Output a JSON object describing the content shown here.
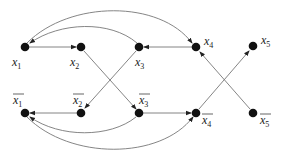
{
  "diagram": {
    "type": "directed-graph",
    "colors": {
      "node": "#111111",
      "edge": "#777777",
      "label": "#222222"
    },
    "nodes": [
      {
        "id": "x1",
        "label": "x",
        "sub": "1",
        "bar": false,
        "x": 25,
        "y": 47,
        "lx": 12,
        "ly": 66
      },
      {
        "id": "x2",
        "label": "x",
        "sub": "2",
        "bar": false,
        "x": 81,
        "y": 47,
        "lx": 70,
        "ly": 66
      },
      {
        "id": "x3",
        "label": "x",
        "sub": "3",
        "bar": false,
        "x": 139,
        "y": 47,
        "lx": 135,
        "ly": 66
      },
      {
        "id": "x4",
        "label": "x",
        "sub": "4",
        "bar": false,
        "x": 196,
        "y": 47,
        "lx": 204,
        "ly": 45
      },
      {
        "id": "x5",
        "label": "x",
        "sub": "5",
        "bar": false,
        "x": 253,
        "y": 46,
        "lx": 261,
        "ly": 44
      },
      {
        "id": "x1bar",
        "label": "x",
        "sub": "1",
        "bar": true,
        "x": 25,
        "y": 113,
        "lx": 13,
        "ly": 104
      },
      {
        "id": "x2bar",
        "label": "x",
        "sub": "2",
        "bar": true,
        "x": 81,
        "y": 113,
        "lx": 73,
        "ly": 104
      },
      {
        "id": "x3bar",
        "label": "x",
        "sub": "3",
        "bar": true,
        "x": 139,
        "y": 113,
        "lx": 139,
        "ly": 104
      },
      {
        "id": "x4bar",
        "label": "x",
        "sub": "4",
        "bar": true,
        "x": 196,
        "y": 113,
        "lx": 202,
        "ly": 124
      },
      {
        "id": "x5bar",
        "label": "x",
        "sub": "5",
        "bar": true,
        "x": 253,
        "y": 113,
        "lx": 260,
        "ly": 124
      }
    ],
    "edges": [
      {
        "from": "x1",
        "to": "x2",
        "d": "M29,47 L76,47"
      },
      {
        "from": "x4",
        "to": "x3",
        "d": "M192,47 L144,47"
      },
      {
        "from": "x3",
        "to": "x1",
        "d": "M137,43 C110,20 60,22 30,43"
      },
      {
        "from": "x1",
        "to": "x4",
        "d": "M27,43 C70,0 160,0 192,43"
      },
      {
        "from": "x2",
        "to": "x3bar",
        "d": "M84,51 L136,109"
      },
      {
        "from": "x3",
        "to": "x2bar",
        "d": "M136,51 L85,108"
      },
      {
        "from": "x4bar",
        "to": "x5",
        "d": "M199,109 L249,51"
      },
      {
        "from": "x5bar",
        "to": "x4",
        "d": "M250,109 L200,52"
      },
      {
        "from": "x2bar",
        "to": "x1bar",
        "d": "M77,113 L30,113"
      },
      {
        "from": "x3bar",
        "to": "x4bar",
        "d": "M143,113 L191,113"
      },
      {
        "from": "x3bar",
        "to": "x1bar",
        "d": "M136,117 C110,138 60,138 30,117"
      },
      {
        "from": "x1bar",
        "to": "x4bar",
        "d": "M27,117 C70,160 160,160 193,117"
      }
    ]
  }
}
